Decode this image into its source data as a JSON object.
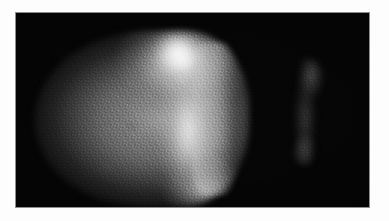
{
  "image": {
    "modality": "scintigraphy",
    "study_name": "liver-spleen-scan",
    "view": "anterior",
    "width": 389,
    "height": 221,
    "alt_text": "Planar nuclear-medicine scintigram: a large bright ovoid hepatic silhouette fills the left two-thirds of the black field, with a focal hot spot in its superior-right aspect and a vertical band of increased uptake; a much fainter elongated splenic silhouette lies to the right."
  },
  "frame": {
    "border_color": "#fdfdfd",
    "hairline_color": "#8e8e8e",
    "field_color": "#030303",
    "border_left": 16,
    "border_top": 13,
    "field_width": 353,
    "field_height": 194
  },
  "regions": [
    {
      "name": "liver",
      "label": "Liver",
      "shape": "large ovoid",
      "position": "left-of-centre",
      "relative_uptake": "high",
      "grey_peak": "#ffffff",
      "grey_mid": "#9a9a9a",
      "bbox": {
        "x": 18,
        "y": 18,
        "w": 215,
        "h": 176
      }
    },
    {
      "name": "liver-hot-spot",
      "label": "Focal hot spot",
      "shape": "small round",
      "position": "superior-right of liver",
      "relative_uptake": "very high",
      "grey_peak": "#ffffff",
      "bbox": {
        "x": 136,
        "y": 20,
        "w": 52,
        "h": 40
      }
    },
    {
      "name": "liver-bright-band",
      "label": "Vertical band of increased uptake",
      "shape": "vertical band",
      "position": "right third of liver",
      "relative_uptake": "high",
      "grey_peak": "#f0f0f0",
      "bbox": {
        "x": 150,
        "y": 56,
        "w": 40,
        "h": 124
      }
    },
    {
      "name": "spleen",
      "label": "Spleen",
      "shape": "elongated vertical",
      "position": "right of field, separated from liver",
      "relative_uptake": "low / faint",
      "grey_peak": "#707070",
      "bbox": {
        "x": 268,
        "y": 45,
        "w": 44,
        "h": 108
      }
    },
    {
      "name": "background",
      "label": "Background activity",
      "shape": "field",
      "position": "whole field",
      "relative_uptake": "none",
      "grey_peak": "#030303",
      "bbox": {
        "x": 0,
        "y": 0,
        "w": 353,
        "h": 194
      }
    }
  ],
  "texture": {
    "name": "photomultiplier-mottle",
    "description": "fine pixelated counting-statistics noise with a faint rectilinear detector grid"
  },
  "annotations": [],
  "overlay_text": []
}
